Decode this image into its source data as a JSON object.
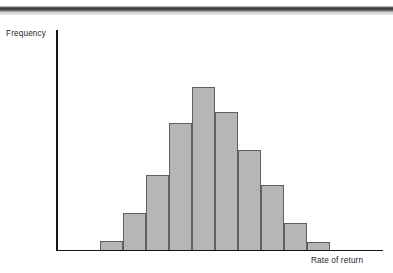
{
  "figure": {
    "background_color": "#ffffff",
    "page_edge_artifact": true
  },
  "chart_data": {
    "type": "bar",
    "title": "",
    "subtitle": "",
    "xlabel": "Rate of return",
    "ylabel": "Frequency",
    "grid": false,
    "legend": false,
    "legend_position": "none",
    "tick_labels_x": [],
    "tick_labels_y": [],
    "xlim": [
      0,
      10
    ],
    "ylim": [
      0,
      180
    ],
    "bar_fill_color": "#b6b6b6",
    "bar_edge_color": "#5f5f5f",
    "axis_color": "#17171a",
    "categories": [
      "1",
      "2",
      "3",
      "4",
      "5",
      "6",
      "7",
      "8",
      "9",
      "10"
    ],
    "values": [
      8,
      36,
      74,
      126,
      162,
      137,
      99,
      64,
      26,
      7
    ],
    "annotations": []
  },
  "bars": [
    {
      "name": "bar-1",
      "left": 100,
      "width": 23,
      "top": 241,
      "height": 9
    },
    {
      "name": "bar-2",
      "left": 123,
      "width": 23,
      "top": 213,
      "height": 37
    },
    {
      "name": "bar-3",
      "left": 146,
      "width": 23,
      "top": 175,
      "height": 75
    },
    {
      "name": "bar-4",
      "left": 169,
      "width": 23,
      "top": 123,
      "height": 127
    },
    {
      "name": "bar-5",
      "left": 192,
      "width": 23,
      "top": 87,
      "height": 163
    },
    {
      "name": "bar-6",
      "left": 215,
      "width": 23,
      "top": 112,
      "height": 138
    },
    {
      "name": "bar-7",
      "left": 238,
      "width": 23,
      "top": 150,
      "height": 100
    },
    {
      "name": "bar-8",
      "left": 261,
      "width": 23,
      "top": 185,
      "height": 65
    },
    {
      "name": "bar-9",
      "left": 284,
      "width": 23,
      "top": 223,
      "height": 27
    },
    {
      "name": "bar-10",
      "left": 307,
      "width": 23,
      "top": 242,
      "height": 8
    }
  ]
}
